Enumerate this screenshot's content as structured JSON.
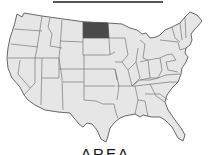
{
  "caption": "AREA",
  "map": {
    "subject": "United States (contiguous) state map",
    "highlighted_state": "North Dakota",
    "colors": {
      "land": "#e6e6e6",
      "border": "#666666",
      "highlight": "#4a4a4a"
    }
  }
}
